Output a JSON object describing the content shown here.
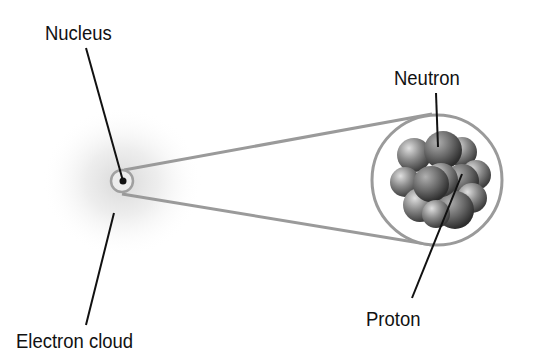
{
  "diagram": {
    "labels": {
      "nucleus": "Nucleus",
      "electron_cloud": "Electron cloud",
      "neutron": "Neutron",
      "proton": "Proton"
    },
    "colors": {
      "label_text": "#111111",
      "leader_line": "#111111",
      "zoom_lines": "#9a9a9a",
      "cloud": "#d8d8d8",
      "particle_dark": "#5a5a5a",
      "particle_light": "#c8c8c8"
    }
  }
}
